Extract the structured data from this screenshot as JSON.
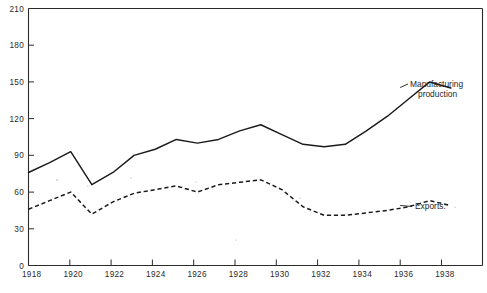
{
  "chart_data": {
    "type": "line",
    "title": "",
    "subtitle": "",
    "xlabel": "",
    "ylabel": "",
    "xlim": [
      1918,
      1939.5
    ],
    "ylim": [
      0,
      210
    ],
    "grid": false,
    "legend_position": "inline-right",
    "x_ticks": [
      1918,
      1920,
      1922,
      1924,
      1926,
      1928,
      1930,
      1932,
      1934,
      1936,
      1938
    ],
    "x_tick_labels": [
      "1918",
      "1920",
      "1922",
      "1924",
      "1926",
      "1928",
      "1930",
      "1932",
      "1934",
      "1936",
      "1938"
    ],
    "y_ticks": [
      0,
      30,
      60,
      90,
      120,
      150,
      180,
      210
    ],
    "y_tick_labels": [
      "0",
      "30",
      "60",
      "90",
      "120",
      "150",
      "180",
      "210"
    ],
    "x": [
      1918,
      1919,
      1920,
      1921,
      1922,
      1923,
      1924,
      1925,
      1926,
      1927,
      1928,
      1929,
      1930,
      1931,
      1932,
      1933,
      1934,
      1935,
      1936,
      1937,
      1938
    ],
    "series": [
      {
        "name": "Manufacturing production",
        "label": "Manufacturing\nproduction",
        "label_line1": "Manufacturing",
        "label_line2": "production",
        "style": "solid",
        "color": "#1a1a1a",
        "values": [
          76,
          84,
          93,
          66,
          76,
          90,
          95,
          103,
          100,
          103,
          110,
          115,
          107,
          99,
          97,
          99,
          110,
          122,
          136,
          150,
          145
        ]
      },
      {
        "name": "Exports",
        "label": "Exports.",
        "style": "dashed",
        "color": "#1a1a1a",
        "values": [
          46,
          53,
          60,
          42,
          52,
          59,
          62,
          65,
          60,
          66,
          68,
          70,
          62,
          48,
          41,
          41,
          43,
          45,
          48,
          53,
          49
        ]
      }
    ]
  },
  "axes": {
    "y_axis_name": "value-axis",
    "x_axis_name": "year-axis"
  }
}
